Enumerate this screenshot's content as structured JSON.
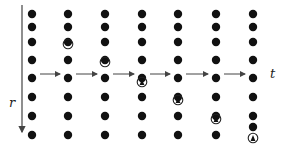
{
  "labels": {
    "r_axis": "r",
    "t_axis": "t"
  },
  "colors": {
    "dot": "#111111",
    "line": "#444444",
    "ring": "#222222"
  },
  "grid": {
    "columns_x": [
      32,
      68,
      105,
      142,
      178,
      216,
      253
    ],
    "rows_y": [
      14,
      27,
      42,
      60,
      78,
      97,
      116,
      135
    ],
    "dot_radius": 4.2
  },
  "rings": [
    {
      "column": 1,
      "dot_row": 2,
      "ring_y": 44,
      "triangle": false
    },
    {
      "column": 2,
      "dot_row": 3,
      "ring_y": 62,
      "triangle": false
    },
    {
      "column": 3,
      "dot_row": 4,
      "ring_y": 82,
      "triangle": true
    },
    {
      "column": 4,
      "dot_row": 5,
      "ring_y": 100,
      "triangle": true
    },
    {
      "column": 5,
      "dot_row": 6,
      "ring_y": 119,
      "triangle": true
    },
    {
      "column": 6,
      "dot_row": 7,
      "ring_y": 138,
      "triangle": true
    }
  ],
  "time_arrows_y": 74,
  "r_arrow": {
    "x": 22,
    "y1": 5,
    "y2": 132
  }
}
